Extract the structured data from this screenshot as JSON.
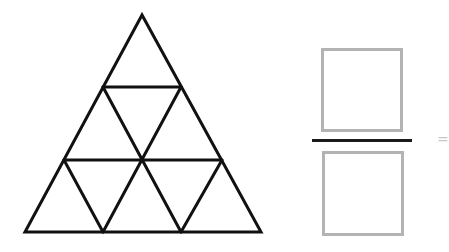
{
  "figure": {
    "title": "",
    "big_triangle": {
      "apex": [
        142,
        15
      ],
      "bottom_left": [
        25,
        232
      ],
      "bottom_right": [
        261,
        232
      ],
      "rows": 3,
      "small_triangle_count": 9,
      "stroke_color": "#111111",
      "stroke_width": 3
    },
    "fraction": {
      "numerator_box": {
        "x": 321,
        "y": 48,
        "w": 82,
        "h": 84,
        "content": ""
      },
      "bar": {
        "x": 312,
        "y": 139,
        "w": 100
      },
      "denominator_box": {
        "x": 322,
        "y": 151,
        "w": 82,
        "h": 85,
        "content": ""
      },
      "box_border_color": "#b3b3b3",
      "bar_color": "#1a1a1a"
    },
    "edge_mark": {
      "text": "=",
      "x": 437,
      "y": 132
    }
  }
}
